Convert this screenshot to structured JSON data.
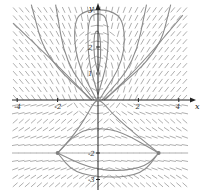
{
  "chart_data": {
    "type": "direction-field",
    "title": "",
    "xlabel": "x",
    "ylabel": "y",
    "xlim": [
      -4.2,
      4.4
    ],
    "ylim": [
      -3.4,
      3.6
    ],
    "x_ticks": [
      {
        "value": -4,
        "label": "-4"
      },
      {
        "value": -2,
        "label": "-2"
      },
      {
        "value": 2,
        "label": "2"
      },
      {
        "value": 4,
        "label": "4"
      }
    ],
    "y_ticks": [
      {
        "value": 4,
        "label": "4"
      },
      {
        "value": 2,
        "label": "2"
      },
      {
        "value": 1,
        "label": "1"
      },
      {
        "value": -2,
        "label": "-2"
      },
      {
        "value": -3,
        "label": "-3"
      }
    ],
    "equilibria": [
      {
        "x": 0,
        "y": 1,
        "kind": "center"
      },
      {
        "x": 0,
        "y": 0,
        "kind": "equilibrium"
      },
      {
        "x": -2,
        "y": -2,
        "kind": "node"
      },
      {
        "x": 3,
        "y": -2,
        "kind": "node"
      }
    ],
    "trajectories": [
      [
        [
          -2,
          -2
        ],
        [
          -1.4,
          -1.5
        ],
        [
          -0.9,
          -1.0
        ],
        [
          -0.5,
          -0.5
        ],
        [
          -0.2,
          -0.1
        ],
        [
          0,
          0
        ]
      ],
      [
        [
          3,
          -2
        ],
        [
          2.2,
          -1.5
        ],
        [
          1.4,
          -1.0
        ],
        [
          0.7,
          -0.5
        ],
        [
          0.25,
          -0.1
        ],
        [
          0,
          0
        ]
      ],
      [
        [
          -2,
          -2
        ],
        [
          -1.0,
          -1.2
        ],
        [
          0,
          -1.05
        ],
        [
          1.2,
          -1.2
        ],
        [
          3,
          -2
        ]
      ],
      [
        [
          -2,
          -2
        ],
        [
          -0.5,
          -2.55
        ],
        [
          1.0,
          -2.7
        ],
        [
          2.4,
          -2.5
        ],
        [
          3,
          -2
        ]
      ],
      [
        [
          -2,
          -2
        ],
        [
          -1.2,
          -2.75
        ],
        [
          0.5,
          -2.95
        ],
        [
          2.2,
          -2.8
        ],
        [
          3,
          -2
        ]
      ],
      [
        [
          0,
          1.05
        ],
        [
          0.15,
          1.6
        ],
        [
          0.1,
          2.6
        ],
        [
          -0.2,
          2.6
        ],
        [
          -0.2,
          1.6
        ],
        [
          0,
          1.05
        ]
      ],
      [
        [
          0,
          0.2
        ],
        [
          0.5,
          1.5
        ],
        [
          0.5,
          3.1
        ],
        [
          0,
          3.3
        ],
        [
          -0.5,
          3.1
        ],
        [
          -0.5,
          1.5
        ],
        [
          0,
          0.2
        ]
      ],
      [
        [
          -0.1,
          0.05
        ],
        [
          -1.1,
          1.5
        ],
        [
          -1.2,
          3.0
        ],
        [
          -0.6,
          3.4
        ],
        [
          0.6,
          3.4
        ],
        [
          1.3,
          3.0
        ],
        [
          1.3,
          1.5
        ],
        [
          0.1,
          0.05
        ]
      ],
      [
        [
          -0.2,
          0.0
        ],
        [
          -1.6,
          1.4
        ],
        [
          -2.1,
          3.6
        ]
      ],
      [
        [
          0.2,
          0.0
        ],
        [
          1.8,
          1.4
        ],
        [
          2.4,
          3.6
        ]
      ],
      [
        [
          -0.3,
          0.0
        ],
        [
          -2.6,
          1.6
        ],
        [
          -3.3,
          3.6
        ]
      ],
      [
        [
          0.3,
          0.0
        ],
        [
          3.0,
          1.8
        ],
        [
          3.6,
          3.6
        ]
      ],
      [
        [
          -4.2,
          2.9
        ],
        [
          -2.0,
          1.3
        ],
        [
          -0.4,
          0.05
        ]
      ],
      [
        [
          4.2,
          3.2
        ],
        [
          2.2,
          1.4
        ],
        [
          0.4,
          0.05
        ]
      ]
    ]
  }
}
